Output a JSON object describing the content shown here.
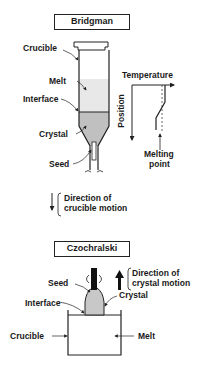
{
  "bridgman": {
    "title": "Bridgman",
    "labels": {
      "crucible": "Crucible",
      "melt": "Melt",
      "interface": "Interface",
      "crystal": "Crystal",
      "seed": "Seed"
    },
    "graph": {
      "x_axis": "Temperature",
      "y_axis": "Position",
      "annotation_line1": "Melting",
      "annotation_line2": "point"
    },
    "motion": {
      "line1": "Direction of",
      "line2": "crucible motion"
    }
  },
  "czochralski": {
    "title": "Czochralski",
    "labels": {
      "seed": "Seed",
      "crystal": "Crystal",
      "interface": "Interface",
      "crucible": "Crucible",
      "melt": "Melt"
    },
    "motion": {
      "line1": "Direction of",
      "line2": "crystal motion"
    }
  },
  "colors": {
    "melt": "#e6e6e6",
    "crystal": "#bdbdbd",
    "line": "#222222"
  }
}
